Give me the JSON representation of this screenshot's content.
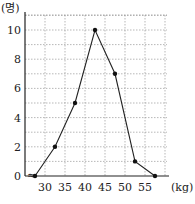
{
  "chart_data": {
    "type": "line",
    "title": "",
    "xlabel": "(kg)",
    "ylabel": "(명)",
    "x": [
      27.5,
      32.5,
      37.5,
      42.5,
      47.5,
      52.5,
      57.5
    ],
    "values": [
      0,
      2,
      5,
      10,
      7,
      1,
      0
    ],
    "x_ticks": [
      "30",
      "35",
      "40",
      "45",
      "50",
      "55"
    ],
    "y_ticks": [
      "0",
      "2",
      "4",
      "6",
      "8",
      "10"
    ],
    "xlim": [
      25,
      60
    ],
    "ylim": [
      0,
      11
    ],
    "grid": true,
    "axis_break_symbol": "≈"
  },
  "labels": {
    "y_unit": "(명)",
    "x_unit": "(kg)",
    "origin": "0"
  }
}
